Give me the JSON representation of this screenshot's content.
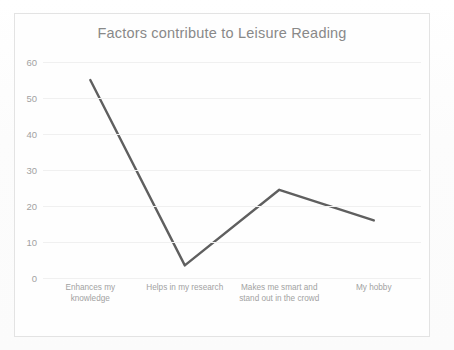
{
  "chart_data": {
    "type": "line",
    "title": "Factors contribute to Leisure Reading",
    "xlabel": "",
    "ylabel": "",
    "categories": [
      "Enhances my knowledge",
      "Helps in my research",
      "Makes me smart and stand out in the crowd",
      "My hobby"
    ],
    "values": [
      55,
      3.5,
      24.5,
      16
    ],
    "series": [
      {
        "name": "Factors",
        "values": [
          55,
          3.5,
          24.5,
          16
        ]
      }
    ],
    "ylim": [
      0,
      60
    ],
    "yticks": [
      0,
      10,
      20,
      30,
      40,
      50,
      60
    ],
    "ytick_labels": [
      "0",
      "10",
      "20",
      "30",
      "40",
      "50",
      "60"
    ],
    "grid": true,
    "legend": false,
    "legend_position": "none",
    "markers": false,
    "line_color": "#5f5f5f",
    "title_color": "#898989",
    "tick_color": "#a2a2a2",
    "gridline_color": "#f0f0f0",
    "border_color": "#e3e3e3",
    "plot_background": "#fefefe"
  },
  "axis": {
    "ytick_labels": [
      "60",
      "50",
      "40",
      "30",
      "20",
      "10",
      "0"
    ]
  },
  "categories_display": [
    "Enhances my knowledge",
    "Helps in my research",
    "Makes me smart and stand out in the crowd",
    "My hobby"
  ]
}
